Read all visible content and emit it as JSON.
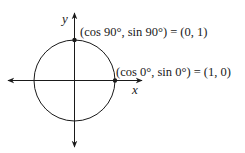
{
  "diagram": {
    "type": "unit-circle",
    "axes": {
      "x_label": "x",
      "y_label": "y"
    },
    "points": [
      {
        "label": "(cos 90°, sin 90°) = (0, 1)",
        "angle_deg": 90,
        "coords": [
          0,
          1
        ]
      },
      {
        "label": "(cos 0°, sin 0°) = (1, 0)",
        "angle_deg": 0,
        "coords": [
          1,
          0
        ]
      }
    ],
    "colors": {
      "stroke": "#1a1a1a",
      "background": "#ffffff"
    }
  }
}
